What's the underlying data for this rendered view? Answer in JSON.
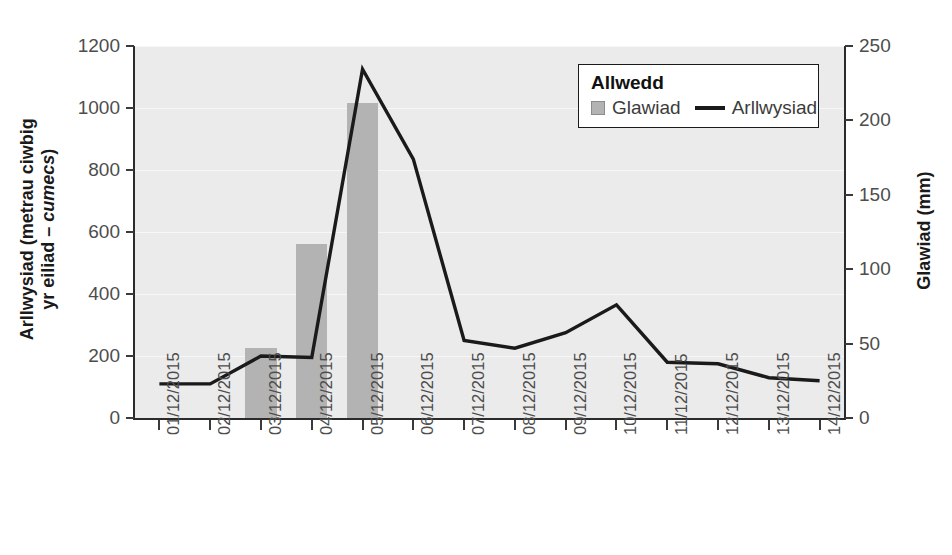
{
  "chart_data": {
    "type": "bar",
    "title": "",
    "subtitle": "",
    "categories": [
      "01/12/2015",
      "02/12/2015",
      "03/12/2015",
      "04/12/2015",
      "05/12/2015",
      "06/12/2015",
      "07/12/2015",
      "08/12/2015",
      "09/12/2015",
      "10/12/2015",
      "11/12/2015",
      "12/12/2015",
      "13/12/2015",
      "14/12/2015"
    ],
    "series": [
      {
        "name": "Glawiad",
        "type": "bar",
        "axis": "right",
        "unit": "mm",
        "color": "#b3b3b3",
        "values": [
          0,
          0,
          47,
          117,
          212,
          0,
          0,
          0,
          0,
          0,
          0,
          0,
          0,
          0
        ]
      },
      {
        "name": "Arllwysiad",
        "type": "line",
        "axis": "left",
        "unit": "cumecs",
        "color": "#1a1a1a",
        "values": [
          110,
          110,
          200,
          195,
          1125,
          835,
          250,
          225,
          275,
          365,
          180,
          175,
          130,
          120
        ]
      }
    ],
    "xlabel": "",
    "ylabel": "Arllwysiad (metrau ciwbig yr eiliad – cumecs)",
    "ylabel_right": "Glawiad (mm)",
    "ylim": [
      0,
      1200
    ],
    "ylim_right": [
      0,
      250
    ],
    "yticks": [
      0,
      200,
      400,
      600,
      800,
      1000,
      1200
    ],
    "yticks_right": [
      0,
      50,
      100,
      150,
      200,
      250
    ],
    "grid": true,
    "grid_color": "#f7f7f7",
    "plot_background": "#ebebeb",
    "legend_position": "top-right"
  },
  "axes": {
    "left": {
      "title_line1": "Arllwysiad (metrau ciwbig",
      "title_line2_pre": "yr eiliad – ",
      "title_line2_italic": "cumecs",
      "title_line2_post": ")",
      "tick_labels": [
        "1200",
        "1000",
        "800",
        "600",
        "400",
        "200",
        "0"
      ]
    },
    "right": {
      "title": "Glawiad (mm)",
      "tick_labels": [
        "250",
        "200",
        "150",
        "100",
        "50",
        "0"
      ]
    },
    "bottom": {
      "tick_labels": [
        "01/12/2015",
        "02/12/2015",
        "03/12/2015",
        "04/12/2015",
        "05/12/2015",
        "06/12/2015",
        "07/12/2015",
        "08/12/2015",
        "09/12/2015",
        "10/12/2015",
        "11/12/2015",
        "12/12/2015",
        "13/12/2015",
        "14/12/2015"
      ]
    }
  },
  "legend": {
    "title": "Allwedd",
    "entries": [
      {
        "label": "Glawiad",
        "marker": "box-swatch-icon",
        "color": "#b3b3b3"
      },
      {
        "label": "Arllwysiad",
        "marker": "line-swatch-icon",
        "color": "#1a1a1a"
      }
    ]
  },
  "colors": {
    "bar": "#b3b3b3",
    "line": "#1a1a1a",
    "plot_bg": "#ebebeb",
    "grid": "#f7f7f7",
    "axis": "#2b2b2b",
    "tick_text": "#4d4d4d",
    "title_text": "#1a1a1a"
  }
}
